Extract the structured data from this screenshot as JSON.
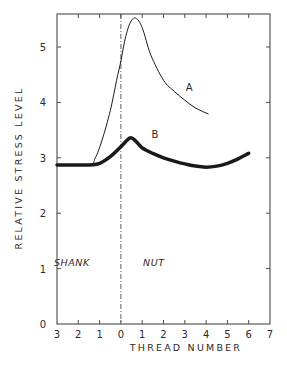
{
  "chart_data": {
    "type": "line",
    "title": "",
    "xlabel": "THREAD NUMBER",
    "ylabel": "RELATIVE STRESS LEVEL",
    "xlim": [
      -3,
      7
    ],
    "ylim": [
      0,
      5.6
    ],
    "x_tick_values": [
      -3,
      -2,
      -1,
      0,
      1,
      2,
      3,
      4,
      5,
      6,
      7
    ],
    "x_tick_labels": [
      "3",
      "2",
      "1",
      "0",
      "1",
      "2",
      "3",
      "4",
      "5",
      "6",
      "7"
    ],
    "y_tick_values": [
      0,
      1,
      2,
      3,
      4,
      5
    ],
    "y_tick_labels": [
      "0",
      "1",
      "2",
      "3",
      "4",
      "5"
    ],
    "grid": false,
    "divider": {
      "x": 0,
      "style": "dash-dot"
    },
    "regions": [
      {
        "label": "SHANK",
        "x": -2.3,
        "y": 1.05
      },
      {
        "label": "NUT",
        "x": 1.55,
        "y": 1.05
      }
    ],
    "series": [
      {
        "name": "A",
        "label_pos": {
          "x": 3.2,
          "y": 4.2
        },
        "stroke_width": 1,
        "points": [
          [
            -3.0,
            2.87
          ],
          [
            -1.5,
            2.87
          ],
          [
            -1.2,
            3.0
          ],
          [
            -0.9,
            3.3
          ],
          [
            -0.5,
            3.85
          ],
          [
            -0.2,
            4.4
          ],
          [
            0.0,
            4.75
          ],
          [
            0.2,
            5.15
          ],
          [
            0.45,
            5.45
          ],
          [
            0.7,
            5.52
          ],
          [
            1.0,
            5.35
          ],
          [
            1.4,
            4.86
          ],
          [
            2.0,
            4.4
          ],
          [
            2.5,
            4.2
          ],
          [
            3.0,
            4.04
          ],
          [
            3.5,
            3.9
          ],
          [
            4.1,
            3.79
          ]
        ]
      },
      {
        "name": "B",
        "label_pos": {
          "x": 1.6,
          "y": 3.35
        },
        "stroke_width": 3.5,
        "points": [
          [
            -3.0,
            2.87
          ],
          [
            -1.5,
            2.87
          ],
          [
            -1.0,
            2.9
          ],
          [
            -0.5,
            3.02
          ],
          [
            0.0,
            3.2
          ],
          [
            0.43,
            3.36
          ],
          [
            0.7,
            3.3
          ],
          [
            1.0,
            3.18
          ],
          [
            1.5,
            3.08
          ],
          [
            2.0,
            3.0
          ],
          [
            2.5,
            2.94
          ],
          [
            3.0,
            2.89
          ],
          [
            3.5,
            2.85
          ],
          [
            4.0,
            2.83
          ],
          [
            4.5,
            2.85
          ],
          [
            5.0,
            2.9
          ],
          [
            5.5,
            2.98
          ],
          [
            6.0,
            3.08
          ]
        ]
      }
    ]
  },
  "colors": {
    "axis": "#4a4a4a",
    "curve": "#1a1a1a",
    "text": "#2a2a2a",
    "background": "#ffffff"
  }
}
